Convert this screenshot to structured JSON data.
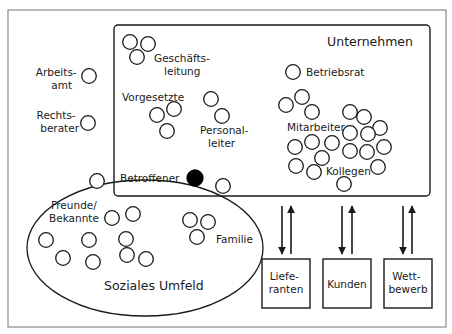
{
  "diagram": {
    "title": "Unternehmen",
    "social_title": "Soziales Umfeld",
    "colors": {
      "line": "#1a1a1a",
      "frame": "#8a8a8a",
      "focus": "#000000",
      "background": "#ffffff"
    },
    "labels": {
      "geschaeftsleitung": [
        "Geschäfts-",
        "leitung"
      ],
      "arbeitsamt": [
        "Arbeits-",
        "amt"
      ],
      "rechtsberater": [
        "Rechts-",
        "berater"
      ],
      "vorgesetzte": "Vorgesetzte",
      "personalleiter": [
        "Personal-",
        "leiter"
      ],
      "betriebsrat": "Betriebsrat",
      "mitarbeiter": "Mitarbeiter",
      "kollegen": "Kollegen",
      "betroffener": "Betroffener",
      "freunde": [
        "Freunde/",
        "Bekannte"
      ],
      "familie": "Familie"
    },
    "external_boxes": [
      {
        "id": "lieferanten",
        "lines": [
          "Liefe-",
          "ranten"
        ]
      },
      {
        "id": "kunden",
        "lines": [
          "Kunden"
        ]
      },
      {
        "id": "wettbewerb",
        "lines": [
          "Wett-",
          "bewerb"
        ]
      }
    ],
    "nodes": {
      "geschaeftsleitung": [
        [
          130,
          42
        ],
        [
          148,
          44
        ],
        [
          137,
          57
        ]
      ],
      "arbeitsamt": [
        [
          89,
          76
        ]
      ],
      "rechtsberater": [
        [
          88,
          123
        ]
      ],
      "vorgesetzte": [
        [
          157,
          115
        ],
        [
          174,
          109
        ],
        [
          167,
          131
        ]
      ],
      "personalleiter": [
        [
          211,
          99
        ],
        [
          222,
          116
        ]
      ],
      "betriebsrat": [
        [
          293,
          72
        ]
      ],
      "mitarbeiter": [
        [
          286,
          105
        ],
        [
          302,
          97
        ],
        [
          312,
          112
        ],
        [
          350,
          112
        ],
        [
          364,
          117
        ],
        [
          380,
          128
        ],
        [
          350,
          133
        ],
        [
          368,
          134
        ],
        [
          384,
          147
        ],
        [
          295,
          147
        ],
        [
          312,
          142
        ],
        [
          332,
          143
        ],
        [
          350,
          151
        ],
        [
          367,
          152
        ],
        [
          322,
          158
        ],
        [
          296,
          166
        ],
        [
          314,
          172
        ],
        [
          378,
          167
        ],
        [
          344,
          184
        ]
      ],
      "betroffener_focus": [
        [
          195,
          178
        ]
      ],
      "betroffener_peer": [
        [
          223,
          186
        ]
      ],
      "freunde": [
        [
          97,
          181
        ],
        [
          112,
          218
        ],
        [
          133,
          214
        ],
        [
          46,
          240
        ],
        [
          89,
          240
        ],
        [
          126,
          239
        ],
        [
          63,
          258
        ],
        [
          127,
          255
        ],
        [
          146,
          259
        ],
        [
          93,
          262
        ]
      ],
      "familie": [
        [
          190,
          220
        ],
        [
          208,
          222
        ],
        [
          197,
          237
        ]
      ]
    }
  }
}
